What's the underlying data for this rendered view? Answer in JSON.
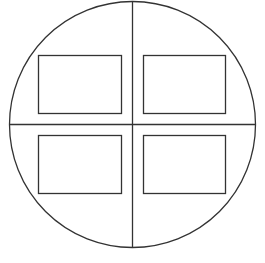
{
  "diagram": {
    "stroke_color": "#333333",
    "background": "#ffffff",
    "circle": {
      "cx": 132.5,
      "cy": 124.5,
      "r": 123
    },
    "quadrants": [
      {
        "name": "top-left",
        "box": {
          "x": 38.5,
          "y": 55.5,
          "w": 83,
          "h": 58
        }
      },
      {
        "name": "top-right",
        "box": {
          "x": 143.5,
          "y": 55.5,
          "w": 82,
          "h": 58
        }
      },
      {
        "name": "bottom-left",
        "box": {
          "x": 38.5,
          "y": 135.5,
          "w": 83,
          "h": 58
        }
      },
      {
        "name": "bottom-right",
        "box": {
          "x": 143.5,
          "y": 135.5,
          "w": 82,
          "h": 58
        }
      }
    ]
  }
}
